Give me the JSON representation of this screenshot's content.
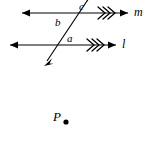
{
  "figure": {
    "kind": "geometry-diagram",
    "width": 152,
    "height": 150,
    "background_color": "#ffffff",
    "stroke_color": "#000000"
  },
  "lines": [
    {
      "id": "line-m",
      "label": "m",
      "label_x": 134,
      "label_y": 8,
      "y": 13,
      "x_start": 22,
      "x_end": 128,
      "arrow_left": true,
      "arrow_right": true,
      "parallel_ticks": 3,
      "tick_center_x": 105
    },
    {
      "id": "line-l",
      "label": "l",
      "label_x": 122,
      "label_y": 39,
      "y": 45,
      "x_start": 10,
      "x_end": 116,
      "arrow_left": true,
      "arrow_right": true,
      "parallel_ticks": 3,
      "tick_center_x": 94
    }
  ],
  "transversal": {
    "id": "transversal",
    "x_top": 89,
    "y_top": 0,
    "x_bottom": 45,
    "y_bottom": 64,
    "arrow_bottom": true,
    "arrow_top": false,
    "note": "extends past the top edge of the image"
  },
  "angles": [
    {
      "id": "angle-c",
      "label": "c",
      "x": 79,
      "y": 1,
      "position": "above line m, right of transversal"
    },
    {
      "id": "angle-b",
      "label": "b",
      "x": 55,
      "y": 17,
      "position": "between lines, left of transversal"
    },
    {
      "id": "angle-a",
      "label": "a",
      "x": 67,
      "y": 33,
      "position": "above line l, right of transversal"
    }
  ],
  "points": [
    {
      "id": "point-P",
      "label": "P",
      "label_x": 53,
      "label_y": 110,
      "dot_x": 66,
      "dot_y": 122,
      "dot_radius": 2.6
    }
  ]
}
